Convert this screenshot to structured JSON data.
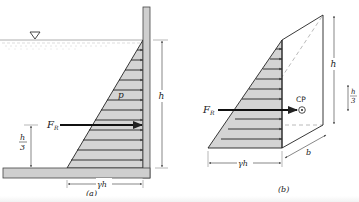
{
  "figure": {
    "panel_a": {
      "label": "(a)",
      "pressure_label": "p",
      "force_label": "F",
      "force_subscript": "R",
      "height_label": "h",
      "third_num": "h",
      "third_den": "3",
      "base_label": "γh",
      "free_surface_symbol": "∇"
    },
    "panel_b": {
      "label": "(b)",
      "force_label": "F",
      "force_subscript": "R",
      "center_label": "CP",
      "height_label": "h",
      "third_num": "h",
      "third_den": "3",
      "base_label": "γh",
      "width_label": "b"
    },
    "colors": {
      "stroke": "#222222",
      "shade": "#d4d4d4",
      "wall": "#cfcfcf",
      "water": "#bdbdbd",
      "dashed": "#a8a8a8"
    }
  }
}
